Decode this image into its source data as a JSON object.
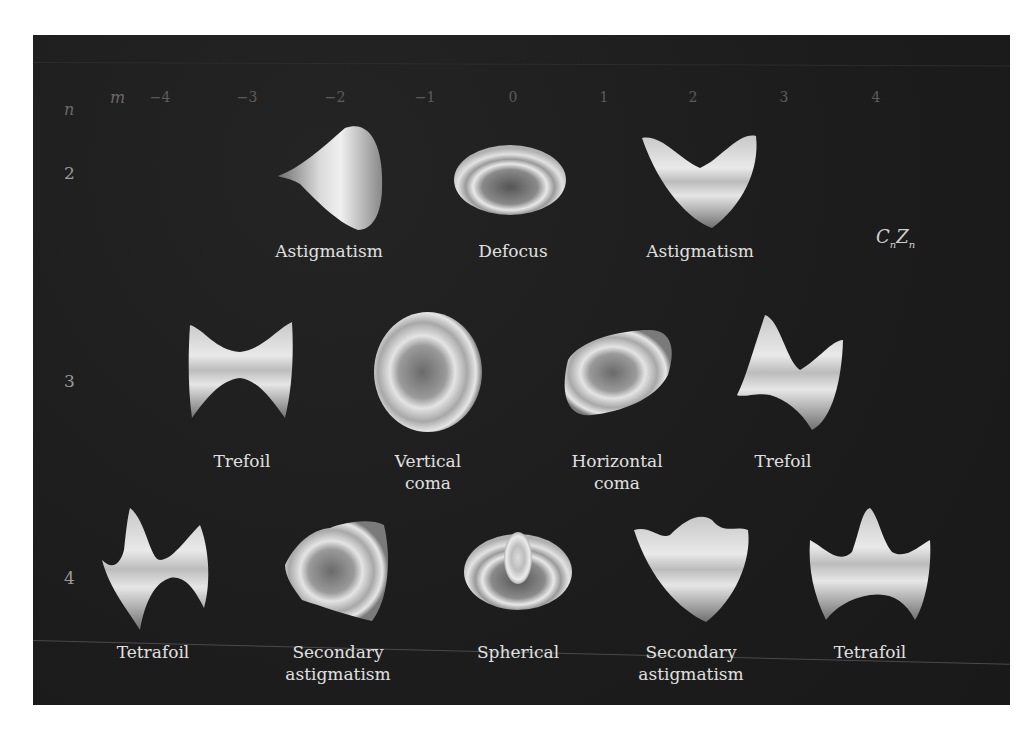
{
  "figure": {
    "legend_formula": {
      "coef": "C",
      "coef_sub": "n",
      "coef_sup": "m",
      "term": "Z",
      "term_sub": "n",
      "term_sup": "m"
    },
    "colors": {
      "background": "#1e1e1e",
      "surface_light": "#e6e6e6",
      "surface_dark": "#5a5a5a",
      "caption": "#e0e0e0",
      "axis": "#5c5c5c"
    }
  },
  "axes": {
    "m_label": "m",
    "n_label": "n",
    "m_ticks": [
      "−4",
      "−3",
      "−2",
      "−1",
      "0",
      "1",
      "2",
      "3",
      "4"
    ],
    "n_ticks": [
      "2",
      "3",
      "4"
    ]
  },
  "rows": [
    {
      "n": "2",
      "items": [
        {
          "m": "−2",
          "name": "Astigmatism",
          "line1": "Astigmatism",
          "line2": ""
        },
        {
          "m": "0",
          "name": "Defocus",
          "line1": "Defocus",
          "line2": ""
        },
        {
          "m": "2",
          "name": "Astigmatism",
          "line1": "Astigmatism",
          "line2": ""
        }
      ]
    },
    {
      "n": "3",
      "items": [
        {
          "m": "−3",
          "name": "Trefoil",
          "line1": "Trefoil",
          "line2": ""
        },
        {
          "m": "−1",
          "name": "Vertical coma",
          "line1": "Vertical",
          "line2": "coma"
        },
        {
          "m": "1",
          "name": "Horizontal coma",
          "line1": "Horizontal",
          "line2": "coma"
        },
        {
          "m": "3",
          "name": "Trefoil",
          "line1": "Trefoil",
          "line2": ""
        }
      ]
    },
    {
      "n": "4",
      "items": [
        {
          "m": "−4",
          "name": "Tetrafoil",
          "line1": "Tetrafoil",
          "line2": ""
        },
        {
          "m": "−2",
          "name": "Secondary astigmatism",
          "line1": "Secondary",
          "line2": "astigmatism"
        },
        {
          "m": "0",
          "name": "Spherical",
          "line1": "Spherical",
          "line2": ""
        },
        {
          "m": "2",
          "name": "Secondary astigmatism",
          "line1": "Secondary",
          "line2": "astigmatism"
        },
        {
          "m": "4",
          "name": "Tetrafoil",
          "line1": "Tetrafoil",
          "line2": ""
        }
      ]
    }
  ]
}
